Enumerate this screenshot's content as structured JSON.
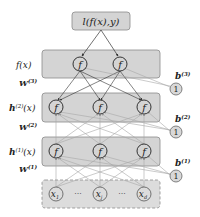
{
  "loss": {
    "label": "l(f(x),y)"
  },
  "layers": [
    {
      "id": "output",
      "label": "f(x)",
      "nodes": 2
    },
    {
      "id": "h2",
      "label": "h(2)(x)",
      "label_main": "h",
      "label_sup": "(2)",
      "label_tail": "(x)",
      "nodes": 3
    },
    {
      "id": "h1",
      "label": "h(1)(x)",
      "label_main": "h",
      "label_sup": "(1)",
      "label_tail": "(x)",
      "nodes": 3
    },
    {
      "id": "input",
      "label": "",
      "nodes": 3
    }
  ],
  "weights": [
    {
      "main": "W",
      "sup": "(3)"
    },
    {
      "main": "W",
      "sup": "(2)"
    },
    {
      "main": "W",
      "sup": "(1)"
    }
  ],
  "biases": [
    {
      "main": "b",
      "sup": "(3)",
      "node": "1"
    },
    {
      "main": "b",
      "sup": "(2)",
      "node": "1"
    },
    {
      "main": "b",
      "sup": "(1)",
      "node": "1"
    }
  ],
  "inputs": {
    "nodes": [
      {
        "main": "x",
        "sub": "1"
      },
      {
        "main": "x",
        "sub": "j"
      },
      {
        "main": "x",
        "sub": "d"
      }
    ],
    "ellipsis": "···"
  },
  "activation_symbol": "f",
  "colors": {
    "box_fill": "#d4d4d4",
    "box_stroke": "#8a8a8a",
    "arrow_dark": "#333333",
    "arrow_light": "#a8a8a8",
    "bias_fill": "#d8d8d8"
  }
}
